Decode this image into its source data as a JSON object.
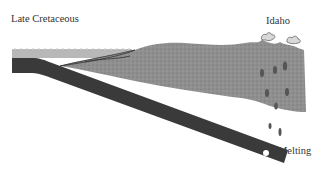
{
  "diagram": {
    "title": "Late Cretaceous",
    "labels": {
      "region": "Idaho",
      "process": "Melting"
    },
    "elements": [
      {
        "name": "ocean-water",
        "description": "shallow sea band over the oceanic plate"
      },
      {
        "name": "subducting-oceanic-slab",
        "description": "dark slab descending beneath continent"
      },
      {
        "name": "continental-crust",
        "description": "stippled gray continental mass"
      },
      {
        "name": "volcanoes",
        "description": "two erupting volcanoes at surface in Idaho"
      },
      {
        "name": "magma-blobs",
        "description": "rising melt droplets from slab tip"
      }
    ],
    "colors": {
      "water": "#b8b8b8",
      "slab": "#3a3a3a",
      "crust": "#8f8f8f",
      "magma": "#555555",
      "text": "#333333"
    }
  }
}
